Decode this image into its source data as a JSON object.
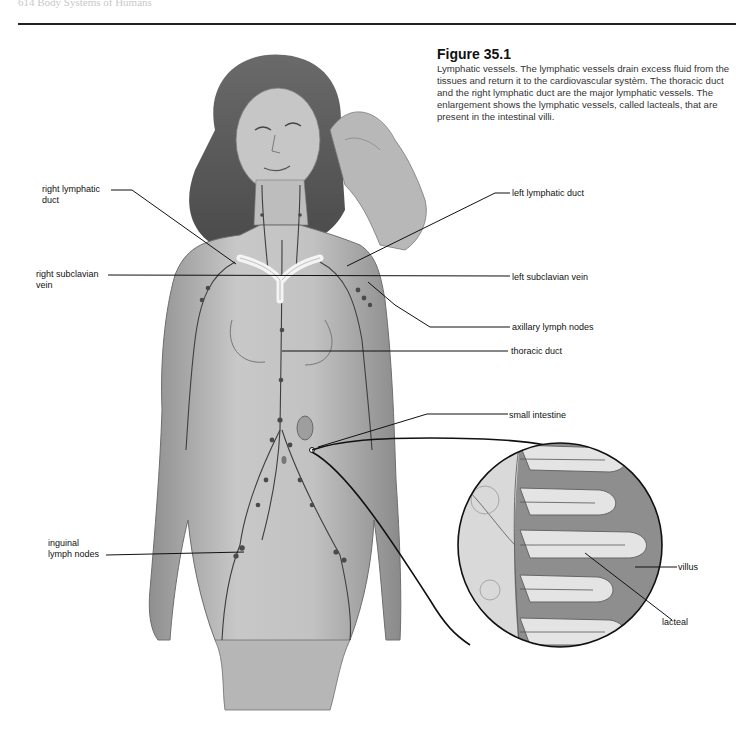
{
  "page": {
    "running_head": "614   Body Systems of Humans"
  },
  "figure": {
    "number": "Figure 35.1",
    "caption": "Lymphatic vessels. The lymphatic vessels drain excess fluid from the tissues and return it to the cardiovascular systèm. The thoracic duct and the right lymphatic duct are the major lymphatic vessels. The enlargement shows the lymphatic vessels, called lacteals, that are present in the intestinal villi."
  },
  "labels": {
    "right_lymphatic_duct": [
      "right lymphatic",
      "duct"
    ],
    "right_subclavian_vein": [
      "right subclavian",
      "vein"
    ],
    "inguinal_lymph_nodes": [
      "inguinal",
      "lymph nodes"
    ],
    "left_lymphatic_duct": "left lymphatic duct",
    "left_subclavian_vein": "left subclavian vein",
    "axillary_lymph_nodes": "axillary lymph nodes",
    "thoracic_duct": "thoracic duct",
    "small_intestine": "small intestine",
    "villus": "villus",
    "lacteal": "lacteal"
  },
  "colors": {
    "leader_line": "#111111",
    "illustration_tone": "#9a9a9a",
    "lumen": "#8c8c8c"
  }
}
